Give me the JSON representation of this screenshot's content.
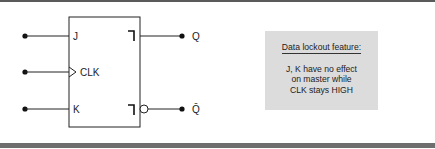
{
  "figure": {
    "block": {
      "name": "JK master-slave flip-flop",
      "inputs": [
        {
          "label": "J",
          "y": 36
        },
        {
          "label": "CLK",
          "y": 72,
          "clock": true
        },
        {
          "label": "K",
          "y": 109
        }
      ],
      "outputs": [
        {
          "label": "Q",
          "y": 36,
          "inverted": false
        },
        {
          "label": "Q̄",
          "y": 109,
          "inverted": true
        }
      ],
      "postponed_output_symbol": "┐"
    },
    "callout": {
      "title": "Data lockout feature:",
      "lines": [
        "J, K have no effect",
        "on master while",
        "CLK stays HIGH"
      ]
    },
    "colors": {
      "line": "#222222",
      "callout_fill": "#dcdcdc",
      "rule_top": "#5a5a5a",
      "rule_bottom": "#6e6e6e"
    }
  }
}
